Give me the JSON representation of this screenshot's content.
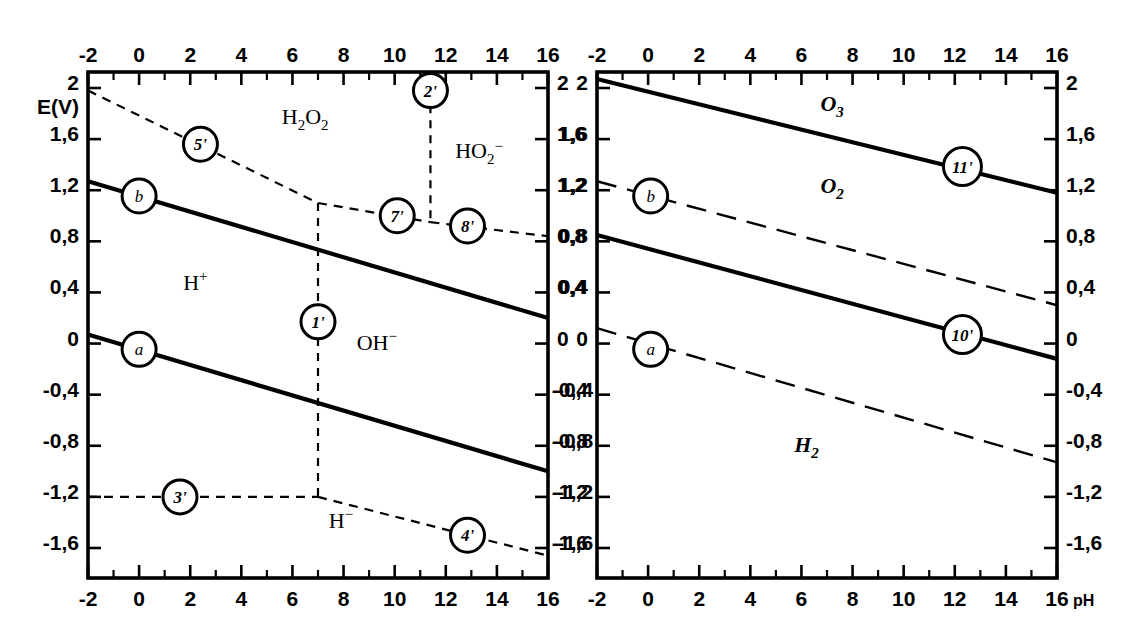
{
  "figure": {
    "background": "#ffffff",
    "ink": "#000000",
    "y_axis_name": "E(V)",
    "x_axis_name": "pH"
  },
  "axes": {
    "x_ticks": [
      "-2",
      "0",
      "2",
      "4",
      "6",
      "8",
      "10",
      "12",
      "14",
      "16"
    ],
    "x_values": [
      -2,
      0,
      2,
      4,
      6,
      8,
      10,
      12,
      14,
      16
    ],
    "x_minor_values": [
      -1,
      1,
      3,
      5,
      7,
      9,
      11,
      13,
      15
    ],
    "y_ticks": [
      "2",
      "1,6",
      "1,2",
      "0,8",
      "0,4",
      "0",
      "-0,4",
      "-0,8",
      "-1,2",
      "-1,6"
    ],
    "y_values": [
      2,
      1.6,
      1.2,
      0.8,
      0.4,
      0,
      -0.4,
      -0.8,
      -1.2,
      -1.6
    ],
    "xlim": [
      -2,
      16
    ],
    "ylim": [
      -1.85,
      2.1
    ]
  },
  "chart_data": {
    "type": "line",
    "xlabel": "pH",
    "ylabel": "E(V)",
    "xlim": [
      -2,
      16
    ],
    "ylim": [
      -1.85,
      2.1
    ],
    "grid": false,
    "legend": "none",
    "panels": [
      {
        "name": "left-panel",
        "regions": [
          {
            "label": "H2O2",
            "text": "H₂O₂",
            "x": 6.5,
            "y": 1.72
          },
          {
            "label": "HO2-",
            "text": "HO₂⁻",
            "x": 13.3,
            "y": 1.45
          },
          {
            "label": "H+",
            "text": "H⁺",
            "x": 2.2,
            "y": 0.42
          },
          {
            "label": "OH-",
            "text": "OH⁻",
            "x": 9.3,
            "y": -0.05
          },
          {
            "label": "H-",
            "text": "H⁻",
            "x": 7.9,
            "y": -1.44
          }
        ],
        "series": [
          {
            "name": "b",
            "style": "solid",
            "marker": "b",
            "points": [
              [
                -2,
                1.27
              ],
              [
                16,
                0.2
              ]
            ]
          },
          {
            "name": "a",
            "style": "solid",
            "marker": "a",
            "points": [
              [
                -2,
                0.07
              ],
              [
                16,
                -1.0
              ]
            ]
          },
          {
            "name": "5'",
            "style": "dashed",
            "marker": "5'",
            "points": [
              [
                -2,
                1.98
              ],
              [
                7.0,
                1.1
              ]
            ]
          },
          {
            "name": "7'",
            "style": "dashed",
            "marker": "7'",
            "points": [
              [
                7.0,
                1.1
              ],
              [
                11.4,
                0.95
              ]
            ]
          },
          {
            "name": "8'",
            "style": "dashed",
            "marker": "8'",
            "points": [
              [
                11.4,
                0.95
              ],
              [
                16,
                0.84
              ]
            ]
          },
          {
            "name": "2'",
            "style": "dashed-vertical",
            "marker": "2'",
            "points": [
              [
                11.4,
                2.1
              ],
              [
                11.4,
                0.95
              ]
            ]
          },
          {
            "name": "1'",
            "style": "dashed-vertical",
            "marker": "1'",
            "points": [
              [
                7.0,
                1.1
              ],
              [
                7.0,
                -1.2
              ]
            ]
          },
          {
            "name": "3'",
            "style": "dashed",
            "marker": "3'",
            "points": [
              [
                -2,
                -1.2
              ],
              [
                7.0,
                -1.2
              ]
            ]
          },
          {
            "name": "4'",
            "style": "dashed",
            "marker": "4'",
            "points": [
              [
                7.0,
                -1.2
              ],
              [
                16,
                -1.66
              ]
            ]
          }
        ],
        "markers": [
          {
            "id": "b",
            "x": 0.0,
            "y": 1.155
          },
          {
            "id": "a",
            "x": 0.0,
            "y": -0.045
          },
          {
            "id": "5'",
            "x": 2.4,
            "y": 1.56
          },
          {
            "id": "7'",
            "x": 10.1,
            "y": 1.0
          },
          {
            "id": "8'",
            "x": 12.85,
            "y": 0.92
          },
          {
            "id": "2'",
            "x": 11.4,
            "y": 1.98
          },
          {
            "id": "1'",
            "x": 7.0,
            "y": 0.17
          },
          {
            "id": "3'",
            "x": 1.6,
            "y": -1.2
          },
          {
            "id": "4'",
            "x": 12.85,
            "y": -1.5
          }
        ]
      },
      {
        "name": "right-panel",
        "regions": [
          {
            "label": "O3",
            "text": "O₃",
            "x": 7.2,
            "y": 1.82
          },
          {
            "label": "O2",
            "text": "O₂",
            "x": 7.2,
            "y": 1.18
          },
          {
            "label": "H2",
            "text": "H₂",
            "x": 6.2,
            "y": -0.85
          }
        ],
        "series": [
          {
            "name": "11'",
            "style": "solid",
            "marker": "11'",
            "points": [
              [
                -2,
                2.07
              ],
              [
                16,
                1.18
              ]
            ]
          },
          {
            "name": "b",
            "style": "dashed-long",
            "marker": "b",
            "points": [
              [
                -2,
                1.27
              ],
              [
                16,
                0.3
              ]
            ]
          },
          {
            "name": "10'",
            "style": "solid",
            "marker": "10'",
            "points": [
              [
                -2,
                0.85
              ],
              [
                16,
                -0.12
              ]
            ]
          },
          {
            "name": "a",
            "style": "dashed-long",
            "marker": "a",
            "points": [
              [
                -2,
                0.12
              ],
              [
                16,
                -0.93
              ]
            ]
          }
        ],
        "markers": [
          {
            "id": "11'",
            "x": 12.3,
            "y": 1.385
          },
          {
            "id": "b",
            "x": 0.1,
            "y": 1.155
          },
          {
            "id": "10'",
            "x": 12.3,
            "y": 0.07
          },
          {
            "id": "a",
            "x": 0.1,
            "y": -0.045
          }
        ]
      }
    ]
  }
}
